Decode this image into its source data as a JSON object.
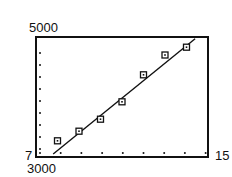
{
  "chart_data": {
    "type": "scatter",
    "title": "",
    "xlabel": "",
    "ylabel": "",
    "xlim": [
      7,
      15
    ],
    "ylim": [
      3000,
      5000
    ],
    "x_tick_step": 1,
    "y_tick_step": 200,
    "grid": false,
    "legend": null,
    "axis_labels": {
      "xmin": "7",
      "xmax": "15",
      "ymin": "3000",
      "ymax": "5000"
    },
    "series": [
      {
        "name": "data",
        "marker": "square",
        "x": [
          8,
          9,
          10,
          11,
          12,
          13,
          14
        ],
        "y": [
          3270,
          3430,
          3630,
          3920,
          4370,
          4700,
          4830
        ]
      }
    ],
    "regression_line": {
      "x": [
        7.8,
        14.4
      ],
      "y": [
        3050,
        4970
      ]
    }
  },
  "colors": {
    "ink": "#111111",
    "background": "#ffffff"
  }
}
